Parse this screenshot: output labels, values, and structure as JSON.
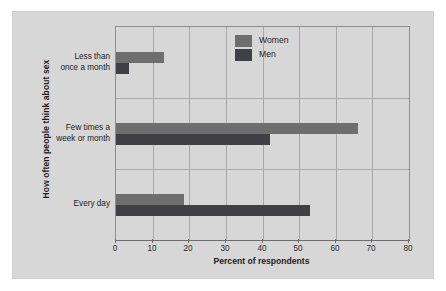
{
  "chart_data": {
    "type": "bar",
    "orientation": "horizontal",
    "title": "",
    "xlabel": "Percent of respondents",
    "ylabel": "How often people think about sex",
    "categories": [
      "Less than once a month",
      "Few times a week or month",
      "Every day"
    ],
    "category_lines": [
      [
        "Less than",
        "once a month"
      ],
      [
        "Few times a",
        "week or month"
      ],
      [
        "Every day"
      ]
    ],
    "series": [
      {
        "name": "Women",
        "color": "#6e6e6e",
        "values": [
          13,
          66,
          18.5
        ]
      },
      {
        "name": "Men",
        "color": "#3f3f46",
        "values": [
          3.5,
          42,
          53
        ]
      }
    ],
    "xlim": [
      0,
      80
    ],
    "xticks": [
      0,
      10,
      20,
      30,
      40,
      50,
      60,
      70,
      80
    ],
    "xticklabels": [
      "0",
      "10",
      "20",
      "30",
      "40",
      "50",
      "60",
      "70",
      "80"
    ],
    "grid": true,
    "legend_position": "top-right",
    "panel_color": "#d7d7d7",
    "grid_color": "#a9a9a9",
    "axis_color": "#6d6d6d"
  },
  "legend": {
    "items": [
      {
        "label": "Women",
        "color": "#6e6e6e"
      },
      {
        "label": "Men",
        "color": "#3f3f46"
      }
    ]
  }
}
